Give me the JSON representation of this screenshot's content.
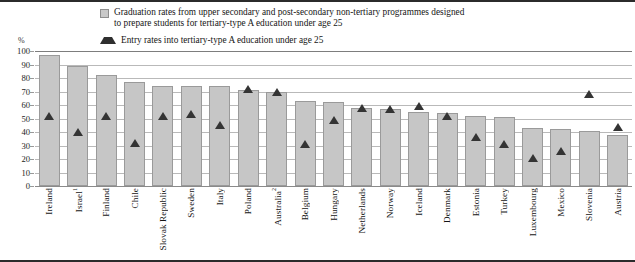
{
  "legend": {
    "series1_line1": "Graduation rates from upper secondary and post-secondary non-tertiary programmes designed",
    "series1_line2": "to prepare students for tertiary-type A education under age 25",
    "series2": "Entry rates into tertiary-type A education under age 25",
    "swatch_bar_name": "bar-swatch",
    "swatch_triangle_name": "triangle-swatch"
  },
  "axis": {
    "unit_label": "%",
    "yticks": [
      "100",
      "90",
      "80",
      "70",
      "60",
      "50",
      "40",
      "30",
      "20",
      "10",
      "0"
    ]
  },
  "colors": {
    "bar_fill": "#c6c6c6",
    "bar_border": "#9a9a9a",
    "marker": "#343434",
    "gridline": "#b9b9b9",
    "rule": "#2b2b2b"
  },
  "chart_data": {
    "type": "bar",
    "title": "",
    "subtitle": "",
    "xlabel": "",
    "ylabel": "%",
    "ylim": [
      0,
      100
    ],
    "ytick_step": 10,
    "grid": true,
    "legend_position": "top",
    "categories": [
      "Ireland",
      "Israel",
      "Finland",
      "Chile",
      "Slovak Republic",
      "Sweden",
      "Italy",
      "Poland",
      "Australia",
      "Belgium",
      "Hungary",
      "Netherlands",
      "Norway",
      "Iceland",
      "Denmark",
      "Estonia",
      "Turkey",
      "Luxembourg",
      "Mexico",
      "Slovenia",
      "Austria"
    ],
    "category_footnotes": {
      "Israel": "1",
      "Australia": "2"
    },
    "series": [
      {
        "name": "Graduation rates from upper secondary and post-secondary non-tertiary programmes designed to prepare students for tertiary-type A education under age 25",
        "type": "bar",
        "values": [
          97,
          89,
          82,
          77,
          74,
          74,
          74,
          71,
          70,
          63,
          62,
          58,
          57,
          55,
          54,
          52,
          51,
          43,
          42,
          41,
          38
        ]
      },
      {
        "name": "Entry rates into tertiary-type A education under age 25",
        "type": "scatter",
        "marker": "triangle",
        "values": [
          52,
          40,
          52,
          32,
          52,
          53,
          45,
          72,
          70,
          31,
          49,
          58,
          57,
          59,
          52,
          36,
          31,
          21,
          26,
          68,
          44
        ]
      }
    ]
  }
}
